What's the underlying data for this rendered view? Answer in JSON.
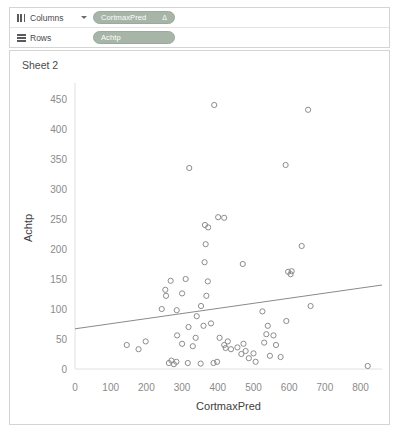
{
  "shelves": {
    "columns": {
      "label": "Columns",
      "glyph": "columns-icon",
      "pill": "CortmaxPred",
      "pill_badge": "Δ"
    },
    "rows": {
      "label": "Rows",
      "glyph": "rows-icon",
      "pill": "Achtp"
    }
  },
  "sheet": {
    "title": "Sheet 2"
  },
  "colors": {
    "pill": "#a6b5a8",
    "mark": "#8c8c8c",
    "trend_line": "#8a8a8a",
    "tick_text": "#8a8a8a",
    "axis_title": "#3d3d3d",
    "pane_border": "#d4d4d4"
  },
  "chart_data": {
    "type": "scatter",
    "title": "Sheet 2",
    "xlabel": "CortmaxPred",
    "ylabel": "Achtp",
    "xlim": [
      0,
      860
    ],
    "ylim": [
      0,
      470
    ],
    "xticks": [
      0,
      100,
      200,
      300,
      400,
      500,
      600,
      700,
      800
    ],
    "yticks": [
      0,
      50,
      100,
      150,
      200,
      250,
      300,
      350,
      400,
      450
    ],
    "grid": false,
    "legend": "none",
    "marker": "open-circle",
    "points": [
      {
        "x": 390,
        "y": 440
      },
      {
        "x": 653,
        "y": 432
      },
      {
        "x": 320,
        "y": 335
      },
      {
        "x": 590,
        "y": 340
      },
      {
        "x": 401,
        "y": 253
      },
      {
        "x": 418,
        "y": 252
      },
      {
        "x": 364,
        "y": 240
      },
      {
        "x": 373,
        "y": 236
      },
      {
        "x": 635,
        "y": 205
      },
      {
        "x": 366,
        "y": 208
      },
      {
        "x": 363,
        "y": 178
      },
      {
        "x": 470,
        "y": 175
      },
      {
        "x": 597,
        "y": 162
      },
      {
        "x": 604,
        "y": 158
      },
      {
        "x": 607,
        "y": 163
      },
      {
        "x": 268,
        "y": 147
      },
      {
        "x": 310,
        "y": 150
      },
      {
        "x": 372,
        "y": 146
      },
      {
        "x": 253,
        "y": 132
      },
      {
        "x": 255,
        "y": 122
      },
      {
        "x": 300,
        "y": 126
      },
      {
        "x": 368,
        "y": 122
      },
      {
        "x": 660,
        "y": 105
      },
      {
        "x": 353,
        "y": 105
      },
      {
        "x": 243,
        "y": 100
      },
      {
        "x": 285,
        "y": 98
      },
      {
        "x": 525,
        "y": 96
      },
      {
        "x": 341,
        "y": 88
      },
      {
        "x": 540,
        "y": 72
      },
      {
        "x": 592,
        "y": 80
      },
      {
        "x": 318,
        "y": 70
      },
      {
        "x": 360,
        "y": 72
      },
      {
        "x": 381,
        "y": 76
      },
      {
        "x": 536,
        "y": 58
      },
      {
        "x": 556,
        "y": 56
      },
      {
        "x": 530,
        "y": 44
      },
      {
        "x": 563,
        "y": 40
      },
      {
        "x": 286,
        "y": 56
      },
      {
        "x": 338,
        "y": 52
      },
      {
        "x": 405,
        "y": 52
      },
      {
        "x": 145,
        "y": 40
      },
      {
        "x": 178,
        "y": 33
      },
      {
        "x": 198,
        "y": 46
      },
      {
        "x": 300,
        "y": 42
      },
      {
        "x": 330,
        "y": 38
      },
      {
        "x": 418,
        "y": 40
      },
      {
        "x": 428,
        "y": 46
      },
      {
        "x": 422,
        "y": 35
      },
      {
        "x": 437,
        "y": 33
      },
      {
        "x": 455,
        "y": 36
      },
      {
        "x": 466,
        "y": 25
      },
      {
        "x": 478,
        "y": 30
      },
      {
        "x": 472,
        "y": 42
      },
      {
        "x": 487,
        "y": 18
      },
      {
        "x": 500,
        "y": 26
      },
      {
        "x": 506,
        "y": 12
      },
      {
        "x": 546,
        "y": 22
      },
      {
        "x": 576,
        "y": 20
      },
      {
        "x": 263,
        "y": 10
      },
      {
        "x": 277,
        "y": 8
      },
      {
        "x": 284,
        "y": 12
      },
      {
        "x": 316,
        "y": 10
      },
      {
        "x": 352,
        "y": 9
      },
      {
        "x": 388,
        "y": 10
      },
      {
        "x": 820,
        "y": 5
      },
      {
        "x": 398,
        "y": 12
      },
      {
        "x": 270,
        "y": 14
      }
    ],
    "trend_line": {
      "x1": 0,
      "y1": 67,
      "x2": 860,
      "y2": 140
    }
  }
}
